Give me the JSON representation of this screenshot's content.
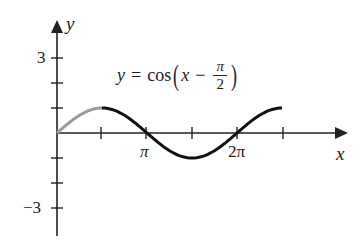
{
  "chart_data": {
    "type": "line",
    "title": "",
    "annotation": {
      "lhs": "y",
      "eq": "=",
      "func": "cos",
      "arg_var": "x",
      "minus": "−",
      "frac_num": "π",
      "frac_den": "2"
    },
    "xlabel": "x",
    "ylabel": "y",
    "x_ticks": [
      "π/2",
      "π",
      "3π/2",
      "2π",
      "5π/2"
    ],
    "x_tick_labels_shown": {
      "pi": "π",
      "two_pi": "2π"
    },
    "y_ticks": [
      3,
      2,
      1,
      -1,
      -2,
      -3
    ],
    "y_tick_labels_shown": {
      "top": "3",
      "bottom": "−3"
    },
    "xlim": [
      0,
      7.85
    ],
    "ylim": [
      -3,
      3
    ],
    "grid": false,
    "series": [
      {
        "name": "y = cos(x − π/2), 0 ≤ x ≤ π/2",
        "color": "#9a9a9a",
        "x_range": [
          0,
          1.5708
        ],
        "function": "cos(x - pi/2)"
      },
      {
        "name": "y = cos(x − π/2), π/2 ≤ x ≤ 5π/2",
        "color": "#111111",
        "x_range": [
          1.5708,
          7.854
        ],
        "function": "cos(x - pi/2)"
      }
    ]
  }
}
